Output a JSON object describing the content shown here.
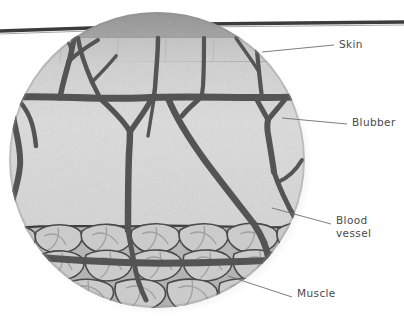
{
  "figure": {
    "background_color": "#ffffff"
  },
  "labels": [
    {
      "id": "skin",
      "text": "Skin",
      "color": "#4a4a4a"
    },
    {
      "id": "blubber",
      "text": "Blubber",
      "color": "#4a4a4a"
    },
    {
      "id": "blood",
      "text": "Blood\nvessel",
      "color": "#4a4a4a"
    },
    {
      "id": "muscle",
      "text": "Muscle",
      "color": "#4a4a4a"
    }
  ],
  "layers": {
    "body_line_color": "#3c3c3c",
    "outer_cap_color": "#9a9a9a",
    "skin_color": "#c9c9c9",
    "blubber_color": "#dcdcdc",
    "muscle_color": "#b5b5b5",
    "muscle_cell_color": "#cfcfcf",
    "vessel_color": "#545454",
    "leader_line_color": "#6e6e6e",
    "shadow_color": "#b9b9b9"
  }
}
